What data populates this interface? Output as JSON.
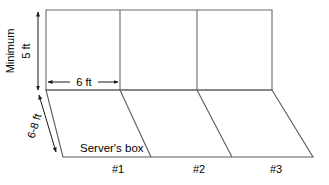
{
  "diagram": {
    "title": "Court wall and server's boxes perspective diagram",
    "colors": {
      "wall_stroke": "#6b6b6b",
      "floor_stroke": "#5a5a5a",
      "dimension_stroke": "#1a1a1a",
      "text": "#000000",
      "background": "#ffffff"
    },
    "dimensions": [
      {
        "id": "height",
        "label_primary": "Minimum",
        "label_secondary": "5 ft",
        "orientation": "vertical",
        "value": "5 ft"
      },
      {
        "id": "width",
        "label_primary": "6 ft",
        "orientation": "horizontal",
        "value": "6 ft"
      },
      {
        "id": "depth",
        "label_primary": "6-8 ft",
        "orientation": "diagonal",
        "value": "6-8 ft"
      }
    ],
    "floor_label": "Server's box",
    "boxes": [
      {
        "label": "#1"
      },
      {
        "label": "#2"
      },
      {
        "label": "#3"
      }
    ]
  }
}
